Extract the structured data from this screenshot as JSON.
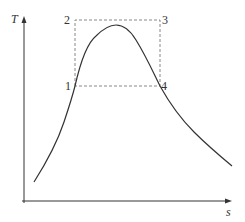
{
  "diagram": {
    "type": "T-s diagram",
    "axes": {
      "y_label": "T",
      "x_label": "s"
    },
    "points": [
      {
        "id": "1",
        "label": "1"
      },
      {
        "id": "2",
        "label": "2"
      },
      {
        "id": "3",
        "label": "3"
      },
      {
        "id": "4",
        "label": "4"
      }
    ],
    "colors": {
      "axis": "#333333",
      "curve": "#333333",
      "dashed_box": "#888888",
      "background": "#ffffff"
    }
  }
}
